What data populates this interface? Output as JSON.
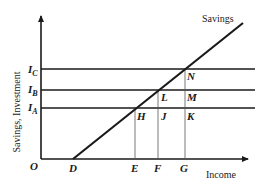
{
  "diagram": {
    "type": "savings-investment",
    "y_axis_label": "Savings, Investment",
    "x_axis_label": "Income",
    "curve_label": "Savings",
    "origin_label": "O",
    "investment_levels": [
      {
        "name": "I_C",
        "main": "I",
        "sub": "C"
      },
      {
        "name": "I_B",
        "main": "I",
        "sub": "B"
      },
      {
        "name": "I_A",
        "main": "I",
        "sub": "A"
      }
    ],
    "x_points": [
      "D",
      "E",
      "F",
      "G"
    ],
    "intersection_points": [
      "H",
      "L",
      "N"
    ],
    "other_points": [
      "J",
      "K",
      "M"
    ],
    "colors": {
      "line": "#1a1a1a",
      "guide": "#555555",
      "background": "#ffffff"
    }
  }
}
